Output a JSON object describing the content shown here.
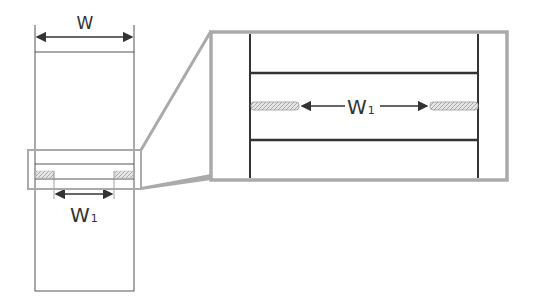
{
  "diagram": {
    "labels": {
      "width": "W",
      "inner_width": "W",
      "inner_width_sub": "1",
      "detail_width": "W",
      "detail_width_sub": "1"
    },
    "colors": {
      "outline": "#555555",
      "dark_line": "#333333",
      "zoom_frame": "#aaaaaa",
      "hatch": "#bbbbbb"
    }
  }
}
